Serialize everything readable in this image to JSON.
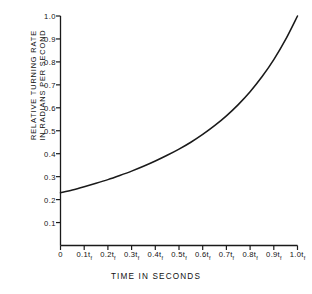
{
  "chart_data": {
    "type": "line",
    "title": "",
    "xlabel": "TIME IN SECONDS",
    "ylabel_line1": "RELATIVE TURNING RATE",
    "ylabel_line2": "IN RADIANS PER SECOND",
    "xlim": [
      0,
      1.0
    ],
    "ylim": [
      0,
      1.0
    ],
    "grid": false,
    "legend": null,
    "x_tick_values": [
      0,
      0.1,
      0.2,
      0.3,
      0.4,
      0.5,
      0.6,
      0.7,
      0.8,
      0.9,
      1.0
    ],
    "x_tick_labels": [
      "0",
      "0.1t",
      "0.2t",
      "0.3t",
      "0.4t",
      "0.5t",
      "0.6t",
      "0.7t",
      "0.8t",
      "0.9t",
      "1.0t"
    ],
    "x_tick_subscript": "f",
    "y_tick_values": [
      0.1,
      0.2,
      0.3,
      0.4,
      0.5,
      0.6,
      0.7,
      0.8,
      0.9,
      1.0
    ],
    "y_tick_labels": [
      "0.1",
      "0.2",
      "0.3",
      "0.4",
      "0.5",
      "0.6",
      "0.7",
      "0.8",
      "0.9",
      "1.0"
    ],
    "series": [
      {
        "name": "relative turning rate",
        "x": [
          0.0,
          0.05,
          0.1,
          0.15,
          0.2,
          0.25,
          0.3,
          0.35,
          0.4,
          0.45,
          0.5,
          0.55,
          0.6,
          0.65,
          0.7,
          0.75,
          0.8,
          0.85,
          0.9,
          0.95,
          1.0
        ],
        "y": [
          0.23,
          0.242,
          0.256,
          0.271,
          0.287,
          0.305,
          0.324,
          0.345,
          0.368,
          0.393,
          0.42,
          0.45,
          0.484,
          0.522,
          0.565,
          0.614,
          0.67,
          0.735,
          0.81,
          0.898,
          1.0
        ]
      }
    ],
    "curve_color": "#1a1a1a",
    "axis_color": "#1a1a1a",
    "background_color": "#ffffff"
  },
  "axes": {
    "y_axis_name": "y-axis",
    "x_axis_name": "x-axis"
  }
}
